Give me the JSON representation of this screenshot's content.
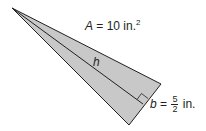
{
  "diagram": {
    "shape": "triangle",
    "fill_color": "#c8c8c8",
    "stroke_color": "#231f20",
    "vertices": {
      "apex": [
        12,
        8
      ],
      "right": [
        161,
        84
      ],
      "bottom": [
        129,
        125
      ]
    },
    "height_foot": [
      143,
      104
    ],
    "area_label": {
      "var": "A",
      "eq": " = 10 in.",
      "exp": "2"
    },
    "height_label": {
      "var": "h"
    },
    "base_label": {
      "var": "b",
      "eq": " = ",
      "num": "5",
      "den": "2",
      "unit": " in."
    }
  }
}
